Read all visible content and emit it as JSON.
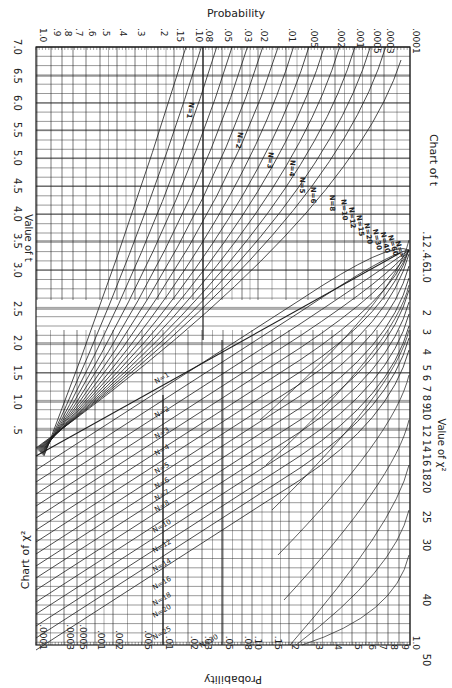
{
  "chart_data": {
    "type": "line",
    "frame": {
      "left": 36,
      "top": 47,
      "right": 410,
      "bottom": 645
    },
    "labels": {
      "top_axis_title": "Probability",
      "bottom_axis_title": "Probability",
      "left_axis_title": "Value of t",
      "right_axis_title": "Value of χ²",
      "chart_t_title": "Chart of t",
      "chart_chi_title": "Chart of χ²"
    },
    "probability_axis": {
      "ticks": [
        "1.0",
        ".9",
        ".8",
        ".7",
        ".6",
        ".5",
        ".4",
        ".3",
        ".2",
        ".15",
        ".10",
        ".08",
        ".05",
        ".03",
        ".02",
        ".01",
        ".005",
        ".002",
        ".001",
        ".0005",
        ".0003",
        ".0001"
      ],
      "top_x": [
        37,
        51,
        62,
        73,
        86,
        100,
        117,
        135,
        158,
        174,
        193,
        203,
        222,
        242,
        258,
        286,
        308,
        335,
        354,
        371,
        384,
        410
      ],
      "bottom_x": [
        410,
        399,
        388,
        377,
        366,
        352,
        332,
        313,
        289,
        272,
        252,
        242,
        223,
        202,
        188,
        163,
        142,
        113,
        95,
        77,
        64,
        37
      ]
    },
    "t_axis": {
      "ticks": [
        "7.0",
        "6.5",
        "6.0",
        "5.5",
        "5.0",
        "4.5",
        "4.0",
        "3.5",
        "3.0",
        "2.5",
        "2.0",
        "1.5",
        "1.0",
        ".5"
      ],
      "y": [
        47,
        76,
        103,
        130,
        158,
        186,
        214,
        241,
        270,
        309,
        343,
        373,
        402,
        430
      ]
    },
    "chi_axis": {
      "ticks": [
        ".1",
        ".2",
        ".4",
        ".6",
        "1.0",
        "2",
        "3",
        "4",
        "5",
        "6",
        "7",
        "8",
        "9",
        "10",
        "12",
        "14",
        "16",
        "18",
        "20",
        "25",
        "30",
        "40",
        "50"
      ],
      "y": [
        236,
        243,
        254,
        263,
        275,
        313,
        332,
        352,
        368,
        378,
        389,
        398,
        406,
        414,
        431,
        446,
        460,
        474,
        487,
        517,
        545,
        600,
        660
      ]
    },
    "t_curves": [
      {
        "n": 1,
        "label": "N=1"
      },
      {
        "n": 2,
        "label": "N=2"
      },
      {
        "n": 3,
        "label": "N=3"
      },
      {
        "n": 4,
        "label": "N=4"
      },
      {
        "n": 5,
        "label": "N=5"
      },
      {
        "n": 6,
        "label": "N=6"
      },
      {
        "n": 8,
        "label": "N=8"
      },
      {
        "n": 10,
        "label": "N=10"
      },
      {
        "n": 12,
        "label": "N=12"
      },
      {
        "n": 15,
        "label": "N=15"
      },
      {
        "n": 20,
        "label": "N=20"
      },
      {
        "n": 30,
        "label": "N=30"
      },
      {
        "n": 40,
        "label": "N=40"
      },
      {
        "n": 60,
        "label": "N=60"
      },
      {
        "n": 999,
        "label": "N=∞"
      }
    ],
    "chi_curves": [
      {
        "n": 1,
        "label": "N=1"
      },
      {
        "n": 2,
        "label": "N=2"
      },
      {
        "n": 3,
        "label": "N=3"
      },
      {
        "n": 4,
        "label": "N=4"
      },
      {
        "n": 5,
        "label": "N=5"
      },
      {
        "n": 6,
        "label": "N=6"
      },
      {
        "n": 7,
        "label": "N=7"
      },
      {
        "n": 8,
        "label": "N=8"
      },
      {
        "n": 10,
        "label": "N=10"
      },
      {
        "n": 12,
        "label": "N=12"
      },
      {
        "n": 14,
        "label": "N=14"
      },
      {
        "n": 16,
        "label": "N=16"
      },
      {
        "n": 18,
        "label": "N=18"
      },
      {
        "n": 20,
        "label": "N=20"
      },
      {
        "n": 25,
        "label": "N=25"
      },
      {
        "n": 30,
        "label": "N=30"
      }
    ],
    "grid": true
  },
  "style": {
    "ink": "#1e1e1e",
    "grid": "#2a2a2a",
    "paper": "#ffffff"
  }
}
